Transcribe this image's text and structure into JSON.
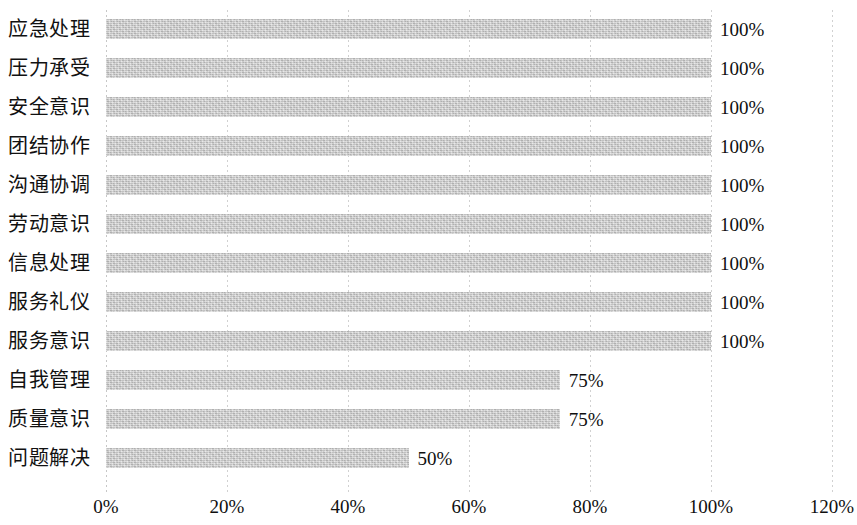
{
  "chart_data": {
    "type": "bar",
    "orientation": "horizontal",
    "title": "",
    "xlabel": "",
    "ylabel": "",
    "xlim": [
      0,
      120
    ],
    "xticks": [
      "0%",
      "20%",
      "40%",
      "60%",
      "80%",
      "100%",
      "120%"
    ],
    "xtick_values": [
      0,
      20,
      40,
      60,
      80,
      100,
      120
    ],
    "grid": true,
    "grid_axis": "x",
    "legend": false,
    "bar_color": "#cdcdcd",
    "categories": [
      "应急处理",
      "压力承受",
      "安全意识",
      "团结协作",
      "沟通协调",
      "劳动意识",
      "信息处理",
      "服务礼仪",
      "服务意识",
      "自我管理",
      "质量意识",
      "问题解决"
    ],
    "values": [
      100,
      100,
      100,
      100,
      100,
      100,
      100,
      100,
      100,
      75,
      75,
      50
    ],
    "data_labels": [
      "100%",
      "100%",
      "100%",
      "100%",
      "100%",
      "100%",
      "100%",
      "100%",
      "100%",
      "75%",
      "75%",
      "50%"
    ]
  }
}
